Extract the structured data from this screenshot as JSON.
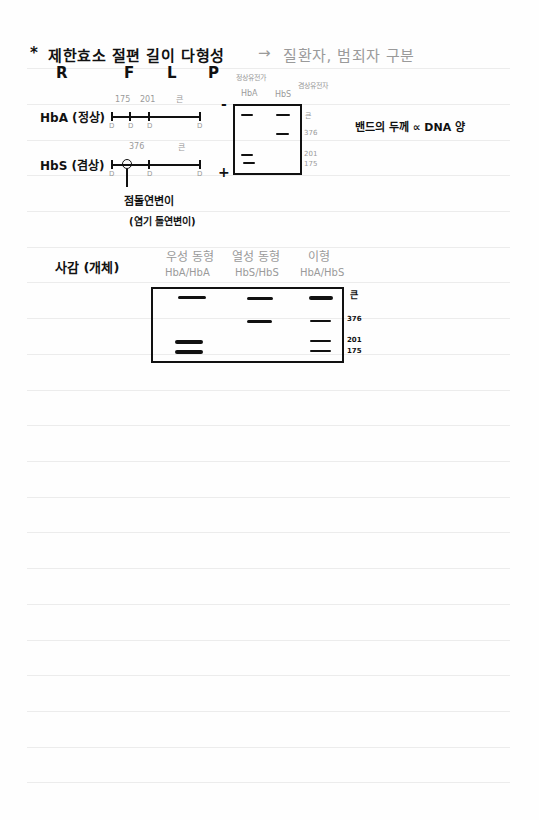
{
  "header": {
    "star": "*",
    "title": "제한효소 절편 길이 다형성",
    "arrow": "→",
    "purpose": "질환자, 범죄자 구분",
    "acronym": [
      "R",
      "F",
      "L",
      "P"
    ]
  },
  "restriction_maps": {
    "rows": [
      {
        "label": "HbA (정상)",
        "segments": [
          "175",
          "201",
          "큰"
        ],
        "site_mark": "D"
      },
      {
        "label": "HbS (겸상)",
        "segments": [
          "376",
          "큰"
        ],
        "site_mark": "D"
      }
    ],
    "mutation_label": "점돌연변이",
    "mutation_sub": "(염기 돌연변이)"
  },
  "gel1": {
    "top_labels": {
      "normal_gene": "정상유전가",
      "carrier_gene": "겸상유전자",
      "lane1": "HbA",
      "lane2": "HbS"
    },
    "minus": "-",
    "plus": "+",
    "size_labels": [
      "큰",
      "376",
      "201",
      "175"
    ]
  },
  "note": "밴드의 두께 ∝ DNA 양",
  "section2": {
    "title": "사감 (개체)",
    "lanes": [
      {
        "type": "우성 동형",
        "genotype": "HbA/HbA"
      },
      {
        "type": "열성 동형",
        "genotype": "HbS/HbS"
      },
      {
        "type": "이형",
        "genotype": "HbA/HbS"
      }
    ],
    "size_labels": [
      "큰",
      "376",
      "201",
      "175"
    ]
  }
}
